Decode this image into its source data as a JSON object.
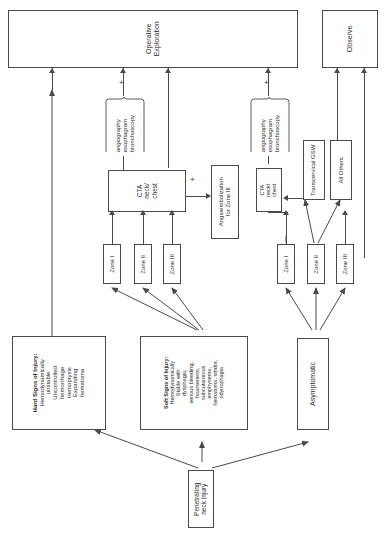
{
  "diagram": {
    "orientation": "rotated-90-ccw",
    "nodes": {
      "operative_exploration": "Operative\nExploration",
      "operative_exploration_line1": "Operative",
      "operative_exploration_line2": "Exploration",
      "observe": "Observe",
      "hard_signs_title": "Hard Signs of Injury:",
      "hard_signs_body": "Hemodynamically unstable Uncontrolled hemorrhage Hemoptysis Expanding hematoma",
      "hard_signs_lines": [
        "Hemodynamically",
        "unstable",
        "Uncontrolled",
        "hemorrhage",
        "Hemoptysis",
        "Expanding",
        "hematoma"
      ],
      "soft_signs_title": "Soft Signs of Injury:",
      "soft_signs_lines": [
        "Hemodynamically",
        "Stable with",
        "dysphagia,",
        "venous bleeding,",
        "hoarseness,",
        "subcutaneous",
        "emphysema,",
        "hematoma, stridor,",
        "odynophagia"
      ],
      "asymptomatic": "Asymptomatic",
      "penetrating_injury_line1": "Penetrating",
      "penetrating_injury_line2": "neck injury",
      "cta_left_line1": "CTA",
      "cta_left_line2": "neck/",
      "cta_left_line3": "chest",
      "cta_right_line1": "CTA",
      "cta_right_line2": "neck/",
      "cta_right_line3": "chest",
      "angioembolization_line1": "Angioembolization",
      "angioembolization_line2": "for Zone III",
      "transcervical_gsw": "Transcervical GSW",
      "all_others": "All Others"
    },
    "zones_left": [
      {
        "label": "Zone I"
      },
      {
        "label": "Zone II"
      },
      {
        "label": "Zone III"
      }
    ],
    "zones_right": [
      {
        "label": "Zone I"
      },
      {
        "label": "Zone II"
      },
      {
        "label": "Zone III"
      }
    ],
    "adjunct_tests_left": [
      "angiography",
      "esophagram",
      "bronchoscopy"
    ],
    "adjunct_tests_right": [
      "angiography",
      "esophagram",
      "bronchoscopy"
    ],
    "plus_signs": [
      {
        "id": "plus-top-left",
        "label": "+"
      },
      {
        "id": "plus-top-right",
        "label": "+"
      },
      {
        "id": "plus-cta-angio",
        "label": "+"
      }
    ],
    "colors": {
      "stroke": "#4a4a4a",
      "text": "#2b2b2b",
      "background": "#ffffff"
    }
  }
}
